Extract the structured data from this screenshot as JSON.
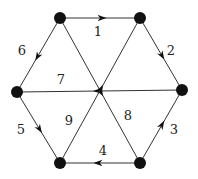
{
  "diagram": {
    "type": "directed-graph",
    "nodes": [
      {
        "id": "TL",
        "x": 60,
        "y": 18
      },
      {
        "id": "TR",
        "x": 140,
        "y": 18
      },
      {
        "id": "L",
        "x": 17,
        "y": 92
      },
      {
        "id": "R",
        "x": 182,
        "y": 90
      },
      {
        "id": "BL",
        "x": 60,
        "y": 163
      },
      {
        "id": "BR",
        "x": 140,
        "y": 163
      }
    ],
    "edges": [
      {
        "label": "1",
        "from": "TL",
        "to": "TR",
        "lx": 98,
        "ly": 36
      },
      {
        "label": "2",
        "from": "TR",
        "to": "R",
        "lx": 171,
        "ly": 55
      },
      {
        "label": "3",
        "from": "BR",
        "to": "R",
        "lx": 174,
        "ly": 134
      },
      {
        "label": "4",
        "from": "BR",
        "to": "BL",
        "lx": 103,
        "ly": 155
      },
      {
        "label": "5",
        "from": "L",
        "to": "BL",
        "lx": 21,
        "ly": 134
      },
      {
        "label": "6",
        "from": "TL",
        "to": "L",
        "lx": 22,
        "ly": 55
      },
      {
        "label": "7",
        "from": "R",
        "to": "L",
        "lx": 61,
        "ly": 84
      },
      {
        "label": "8",
        "from": "TL",
        "to": "BR",
        "lx": 128,
        "ly": 120
      },
      {
        "label": "9",
        "from": "BL",
        "to": "TR",
        "lx": 69,
        "ly": 125
      }
    ]
  }
}
